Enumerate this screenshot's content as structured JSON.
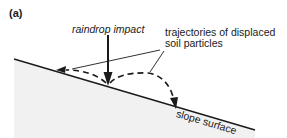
{
  "figure": {
    "panel_label": "(a)",
    "labels": {
      "raindrop_impact": "raindrop impact",
      "trajectories_line1": "trajectories of displaced",
      "trajectories_line2": "soil particles",
      "slope_surface": "slope surface"
    },
    "elements": [
      {
        "type": "slope-line",
        "description": "inclined ground surface descending left to right"
      },
      {
        "type": "ground-fill",
        "description": "light grey shaded soil below slope"
      },
      {
        "type": "arrow",
        "description": "vertical solid arrow: raindrop impact onto slope"
      },
      {
        "type": "dashed-arrow",
        "description": "short upslope trajectory of displaced particle"
      },
      {
        "type": "dashed-arrow",
        "description": "longer downslope trajectory of displaced particle"
      },
      {
        "type": "leader-lines",
        "description": "two lines connecting label to trajectories"
      }
    ],
    "colors": {
      "ink": "#1a1a1a",
      "ground": "#efefef",
      "background": "#ffffff"
    }
  }
}
